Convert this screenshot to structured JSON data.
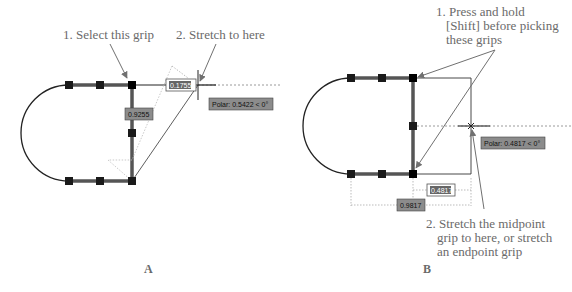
{
  "panels": [
    {
      "label": "A",
      "callouts": {
        "step1": "1. Select this grip",
        "step2": "2. Stretch to here"
      },
      "dimension_input_active": "0.1755",
      "dimension_readout": "0.9255",
      "polar_tooltip": "Polar: 0.5422 < 0°"
    },
    {
      "label": "B",
      "callouts": {
        "step1_line1": "1. Press and hold",
        "step1_line2": "[Shift] before picking",
        "step1_line3": "these grips",
        "step2_line1": "2. Stretch the midpoint",
        "step2_line2": "grip to here, or stretch",
        "step2_line3": "an endpoint grip"
      },
      "dimension_input_active": "0.4817",
      "dimension_readout": "0.9817",
      "polar_tooltip": "Polar: 0.4817 < 0°"
    }
  ],
  "colors": {
    "geometry": "#222222",
    "grip": "#1a1a1a",
    "leader": "#707070",
    "tooltip_bg": "#8c8c8c",
    "tooltip_text": "#111111",
    "tracking": "#9a9a9a"
  }
}
